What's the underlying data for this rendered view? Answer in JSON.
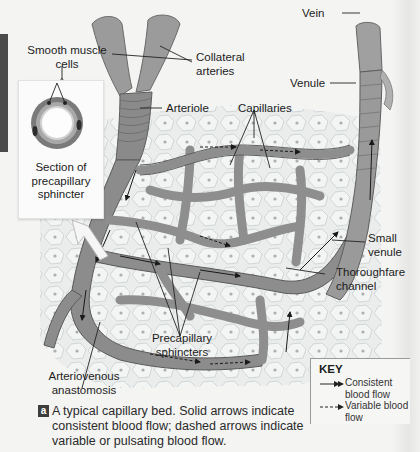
{
  "figure": {
    "panel_letter": "a",
    "caption": "A typical capillary bed. Solid arrows indicate consistent blood flow; dashed arrows indicate variable or pulsating blood flow."
  },
  "labels": {
    "smooth_muscle_cells": "Smooth muscle cells",
    "collateral_arteries": "Collateral arteries",
    "arteriole": "Arteriole",
    "capillaries": "Capillaries",
    "vein": "Vein",
    "venule": "Venule",
    "section_of_precapillary_sphincter": "Section of precapillary sphincter",
    "small_venule": "Small venule",
    "thoroughfare_channel": "Thoroughfare channel",
    "precapillary_sphincters": "Precapillary sphincters",
    "arteriovenous_anastomosis": "Arteriovenous anastomosis"
  },
  "key": {
    "title": "KEY",
    "items": [
      {
        "line": "solid-arrow",
        "label": "Consistent blood flow"
      },
      {
        "line": "dashed-arrow",
        "label": "Variable blood flow"
      }
    ]
  },
  "colors": {
    "vessel_fill": "#8e8e8e",
    "vessel_dark": "#5a5a5a",
    "tissue_fill": "#e9ecec",
    "cell_nucleus": "#a6a6a6",
    "background": "#f4f4f3",
    "caption_badge": "#3d3d3d"
  }
}
